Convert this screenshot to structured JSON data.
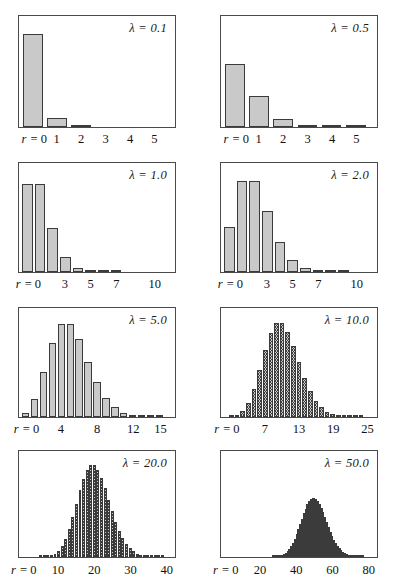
{
  "figure": {
    "title": "",
    "axis_prefix": "r =",
    "lambda_symbol": "λ"
  },
  "chart_data": [
    {
      "type": "bar",
      "title": "λ = 0.1",
      "lambda": 0.1,
      "xlabel": "r",
      "ylabel": "",
      "xlim": [
        -0.5,
        5.8
      ],
      "ylim": [
        0,
        1.0
      ],
      "grid": false,
      "legend": "none",
      "tick_labels": [
        "r = 0",
        "1",
        "2",
        "3",
        "4",
        "5"
      ],
      "tick_values": [
        0,
        1,
        2,
        3,
        4,
        5
      ],
      "categories": [
        0,
        1,
        2,
        3,
        4,
        5
      ],
      "values": [
        0.905,
        0.09,
        0.005,
        0.0,
        0.0,
        0.0
      ]
    },
    {
      "type": "bar",
      "title": "λ = 0.5",
      "lambda": 0.5,
      "xlabel": "r",
      "ylabel": "",
      "xlim": [
        -0.5,
        5.8
      ],
      "ylim": [
        0,
        1.0
      ],
      "grid": false,
      "legend": "none",
      "tick_labels": [
        "r = 0",
        "1",
        "2",
        "3",
        "4",
        "5"
      ],
      "tick_values": [
        0,
        1,
        2,
        3,
        4,
        5
      ],
      "categories": [
        0,
        1,
        2,
        3,
        4,
        5
      ],
      "values": [
        0.607,
        0.303,
        0.076,
        0.013,
        0.0016,
        0.0002
      ]
    },
    {
      "type": "bar",
      "title": "λ = 1.0",
      "lambda": 1.0,
      "xlabel": "r",
      "ylabel": "",
      "xlim": [
        -0.5,
        11.5
      ],
      "ylim": [
        0,
        0.42
      ],
      "grid": false,
      "legend": "none",
      "tick_labels": [
        "r = 0",
        "3",
        "5",
        "7",
        "10"
      ],
      "tick_values": [
        0,
        3,
        5,
        7,
        10
      ],
      "categories": [
        0,
        1,
        2,
        3,
        4,
        5,
        6,
        7,
        8,
        9,
        10
      ],
      "values": [
        0.368,
        0.368,
        0.184,
        0.061,
        0.015,
        0.003,
        0.0005,
        0.0001,
        0.0,
        0.0,
        0.0
      ]
    },
    {
      "type": "bar",
      "title": "λ = 2.0",
      "lambda": 2.0,
      "xlabel": "r",
      "ylabel": "",
      "xlim": [
        -0.5,
        11.5
      ],
      "ylim": [
        0,
        0.3
      ],
      "grid": false,
      "legend": "none",
      "tick_labels": [
        "r = 0",
        "3",
        "5",
        "7",
        "10"
      ],
      "tick_values": [
        0,
        3,
        5,
        7,
        10
      ],
      "categories": [
        0,
        1,
        2,
        3,
        4,
        5,
        6,
        7,
        8,
        9,
        10
      ],
      "values": [
        0.135,
        0.271,
        0.271,
        0.18,
        0.09,
        0.036,
        0.012,
        0.0034,
        0.0009,
        0.0002,
        0.0
      ]
    },
    {
      "type": "bar",
      "title": "λ = 5.0",
      "lambda": 5.0,
      "xlabel": "r",
      "ylabel": "",
      "xlim": [
        -0.5,
        16.5
      ],
      "ylim": [
        0,
        0.19
      ],
      "grid": false,
      "legend": "none",
      "tick_labels": [
        "r = 0",
        "4",
        "8",
        "12",
        "15"
      ],
      "tick_values": [
        0,
        4,
        8,
        12,
        15
      ],
      "categories": [
        0,
        1,
        2,
        3,
        4,
        5,
        6,
        7,
        8,
        9,
        10,
        11,
        12,
        13,
        14,
        15
      ],
      "values": [
        0.007,
        0.034,
        0.084,
        0.14,
        0.175,
        0.175,
        0.146,
        0.104,
        0.065,
        0.036,
        0.018,
        0.008,
        0.003,
        0.0013,
        0.0005,
        0.0002
      ]
    },
    {
      "type": "bar",
      "title": "λ = 10.0",
      "lambda": 10.0,
      "xlabel": "r",
      "ylabel": "",
      "xlim": [
        -0.5,
        26.5
      ],
      "ylim": [
        0,
        0.135
      ],
      "grid": false,
      "legend": "none",
      "tick_labels": [
        "r = 0",
        "7",
        "13",
        "19",
        "25"
      ],
      "tick_values": [
        0,
        7,
        13,
        19,
        25
      ],
      "categories": [
        0,
        1,
        2,
        3,
        4,
        5,
        6,
        7,
        8,
        9,
        10,
        11,
        12,
        13,
        14,
        15,
        16,
        17,
        18,
        19,
        20,
        21,
        22,
        23,
        24,
        25
      ],
      "values": [
        0.0,
        0.0005,
        0.0023,
        0.0076,
        0.0189,
        0.0378,
        0.063,
        0.09,
        0.1126,
        0.1251,
        0.1251,
        0.1137,
        0.0948,
        0.0729,
        0.0521,
        0.0347,
        0.0217,
        0.0128,
        0.0071,
        0.0037,
        0.0019,
        0.0009,
        0.0004,
        0.0002,
        0.0001,
        0.0
      ]
    },
    {
      "type": "bar",
      "title": "λ = 20.0",
      "lambda": 20.0,
      "xlabel": "r",
      "ylabel": "",
      "xlim": [
        -0.5,
        42
      ],
      "ylim": [
        0,
        0.095
      ],
      "grid": false,
      "legend": "none",
      "tick_labels": [
        "r = 0",
        "10",
        "20",
        "30",
        "40"
      ],
      "tick_values": [
        0,
        10,
        20,
        30,
        40
      ],
      "categories": [
        0,
        1,
        2,
        3,
        4,
        5,
        6,
        7,
        8,
        9,
        10,
        11,
        12,
        13,
        14,
        15,
        16,
        17,
        18,
        19,
        20,
        21,
        22,
        23,
        24,
        25,
        26,
        27,
        28,
        29,
        30,
        31,
        32,
        33,
        34,
        35,
        36,
        37,
        38,
        39,
        40
      ],
      "values": [
        0.0,
        0.0,
        0.0,
        0.0,
        0.0,
        0.0001,
        0.0002,
        0.0005,
        0.0013,
        0.0029,
        0.0058,
        0.0106,
        0.0176,
        0.0271,
        0.0387,
        0.0516,
        0.0646,
        0.076,
        0.0844,
        0.0888,
        0.0888,
        0.0846,
        0.0769,
        0.0669,
        0.0557,
        0.0446,
        0.0343,
        0.0254,
        0.0181,
        0.0125,
        0.0083,
        0.0054,
        0.0034,
        0.002,
        0.0012,
        0.0007,
        0.0004,
        0.0002,
        0.0001,
        0.0001,
        0.0
      ]
    },
    {
      "type": "bar",
      "title": "λ = 50.0",
      "lambda": 50.0,
      "xlabel": "r",
      "ylabel": "",
      "xlim": [
        -1,
        84
      ],
      "ylim": [
        0,
        0.06
      ],
      "grid": false,
      "legend": "none",
      "tick_labels": [
        "r = 0",
        "20",
        "40",
        "60",
        "80"
      ],
      "tick_values": [
        0,
        20,
        40,
        60,
        80
      ],
      "categories": [
        0,
        1,
        2,
        3,
        4,
        5,
        6,
        7,
        8,
        9,
        10,
        11,
        12,
        13,
        14,
        15,
        16,
        17,
        18,
        19,
        20,
        21,
        22,
        23,
        24,
        25,
        26,
        27,
        28,
        29,
        30,
        31,
        32,
        33,
        34,
        35,
        36,
        37,
        38,
        39,
        40,
        41,
        42,
        43,
        44,
        45,
        46,
        47,
        48,
        49,
        50,
        51,
        52,
        53,
        54,
        55,
        56,
        57,
        58,
        59,
        60,
        61,
        62,
        63,
        64,
        65,
        66,
        67,
        68,
        69,
        70,
        71,
        72,
        73,
        74,
        75,
        76,
        77,
        78,
        79,
        80
      ],
      "values": [
        0.0,
        0.0,
        0.0,
        0.0,
        0.0,
        0.0,
        0.0,
        0.0,
        0.0,
        0.0,
        0.0,
        0.0,
        0.0,
        0.0,
        0.0,
        0.0,
        0.0,
        0.0,
        0.0,
        0.0,
        0.0,
        0.0,
        0.0,
        0.0,
        0.0,
        0.0,
        0.0,
        0.0001,
        0.0001,
        0.0002,
        0.0004,
        0.0007,
        0.0011,
        0.0017,
        0.0025,
        0.0035,
        0.0049,
        0.0066,
        0.0087,
        0.0111,
        0.0139,
        0.0169,
        0.0201,
        0.0234,
        0.0267,
        0.0296,
        0.0322,
        0.0342,
        0.0357,
        0.0364,
        0.0364,
        0.0357,
        0.0343,
        0.0324,
        0.03,
        0.0273,
        0.0244,
        0.0214,
        0.0184,
        0.0156,
        0.013,
        0.0107,
        0.0086,
        0.0068,
        0.0053,
        0.0041,
        0.0031,
        0.0023,
        0.0017,
        0.0012,
        0.0009,
        0.0006,
        0.0004,
        0.0003,
        0.0002,
        0.0001,
        0.0001,
        0.0001,
        0.0,
        0.0,
        0.0
      ]
    }
  ]
}
